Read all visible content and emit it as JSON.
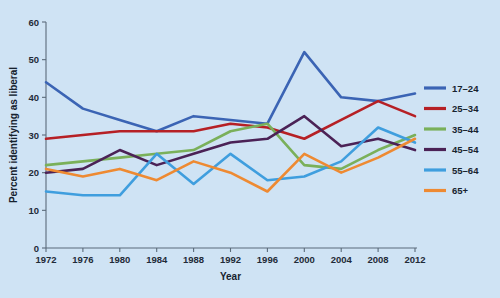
{
  "chart_data": {
    "type": "line",
    "title": "",
    "xlabel": "Year",
    "ylabel": "Percent identifying as liberal",
    "x": [
      1972,
      1976,
      1980,
      1984,
      1988,
      1992,
      1996,
      2000,
      2004,
      2008,
      2012
    ],
    "xtick_labels": [
      "1972",
      "1976",
      "1980",
      "1984",
      "1988",
      "1992",
      "1996",
      "2000",
      "2004",
      "2008",
      "2012"
    ],
    "ytick_labels": [
      "0",
      "10",
      "20",
      "30",
      "40",
      "50",
      "60"
    ],
    "yticks": [
      0,
      10,
      20,
      30,
      40,
      50,
      60
    ],
    "xlim": [
      1972,
      2012
    ],
    "ylim": [
      0,
      60
    ],
    "grid": false,
    "legend_position": "right",
    "series": [
      {
        "name": "17–24",
        "color": "#3b64b4",
        "values": [
          44,
          37,
          34,
          31,
          35,
          34,
          33,
          52,
          40,
          39,
          41
        ]
      },
      {
        "name": "25–34",
        "color": "#b62025",
        "values": [
          29,
          30,
          31,
          31,
          31,
          33,
          32,
          29,
          34,
          39,
          35
        ]
      },
      {
        "name": "35–44",
        "color": "#7ab05a",
        "values": [
          22,
          23,
          24,
          25,
          26,
          31,
          33,
          22,
          21,
          26,
          30
        ]
      },
      {
        "name": "45–54",
        "color": "#4b2256",
        "values": [
          20,
          21,
          26,
          22,
          25,
          28,
          29,
          35,
          27,
          29,
          26
        ]
      },
      {
        "name": "55–64",
        "color": "#3f9ede",
        "values": [
          15,
          14,
          14,
          25,
          17,
          25,
          18,
          19,
          23,
          32,
          28
        ]
      },
      {
        "name": "65+",
        "color": "#ee8a32",
        "values": [
          21,
          19,
          21,
          18,
          23,
          20,
          15,
          25,
          20,
          24,
          29
        ]
      }
    ]
  }
}
